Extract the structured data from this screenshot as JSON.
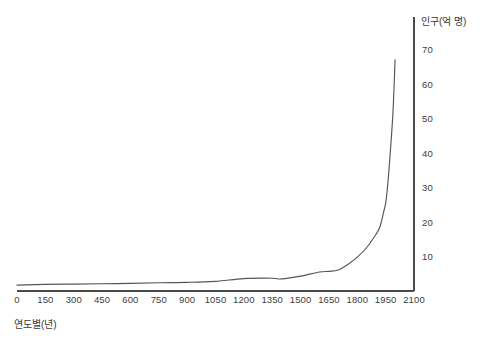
{
  "chart_data": {
    "type": "line",
    "title": "",
    "subtitle": "",
    "xlabel": "연도별(년)",
    "ylabel": "인구(억 명)",
    "xlim": [
      0,
      2100
    ],
    "ylim": [
      0,
      73
    ],
    "grid": false,
    "legend": false,
    "legend_position": "none",
    "line_color": "#555555",
    "axis_color": "#4a4a4a",
    "x_ticks": [
      0,
      150,
      300,
      450,
      600,
      750,
      900,
      1050,
      1200,
      1350,
      1500,
      1650,
      1800,
      1950,
      2100
    ],
    "x_tick_labels": [
      "0",
      "150",
      "300",
      "450",
      "600",
      "750",
      "900",
      "1050",
      "1200",
      "1350",
      "1500",
      "1650",
      "1800",
      "1950",
      "2100"
    ],
    "y_ticks": [
      10,
      20,
      30,
      40,
      50,
      60,
      70
    ],
    "y_tick_labels": [
      "10",
      "20",
      "30",
      "40",
      "50",
      "60",
      "70"
    ],
    "series": [
      {
        "name": "세계 인구",
        "x": [
          0,
          150,
          300,
          450,
          600,
          750,
          900,
          1050,
          1200,
          1350,
          1400,
          1500,
          1600,
          1650,
          1700,
          1750,
          1800,
          1850,
          1900,
          1920,
          1940,
          1950,
          1960,
          1970,
          1980,
          1990,
          2000
        ],
        "values": [
          1.7,
          1.9,
          2.0,
          2.1,
          2.2,
          2.4,
          2.5,
          2.8,
          3.6,
          3.7,
          3.5,
          4.3,
          5.5,
          5.7,
          6.1,
          7.7,
          9.8,
          12.6,
          16.5,
          18.6,
          23.0,
          25.4,
          30.2,
          36.8,
          44.3,
          53.0,
          67.0
        ]
      }
    ],
    "annotations": []
  }
}
